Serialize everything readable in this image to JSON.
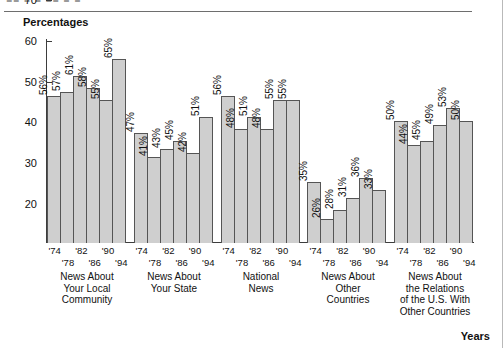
{
  "page": {
    "cropped_header_text": "■■ ■ ■ ■■ ■ ■",
    "years_axis_label": "Years"
  },
  "chart_data": {
    "type": "bar",
    "title": "Percentages",
    "xlabel": "Years",
    "ylabel": "Percentages",
    "ylim": [
      20,
      70
    ],
    "yticks": [
      20,
      30,
      40,
      50,
      60,
      70
    ],
    "grid": false,
    "legend": "none",
    "categories": [
      "'74",
      "'78",
      "'82",
      "'86",
      "'90",
      "'94"
    ],
    "groups": [
      {
        "name": "News About Your Local Community",
        "name_lines": [
          "News About",
          "Your Local",
          "Community"
        ],
        "values": [
          56,
          57,
          61,
          58,
          55,
          65
        ],
        "labels": [
          "56%",
          "57%",
          "61%",
          "58%",
          "55%",
          "65%"
        ]
      },
      {
        "name": "News About Your State",
        "name_lines": [
          "News About",
          "Your State"
        ],
        "values": [
          47,
          41,
          43,
          45,
          42,
          51
        ],
        "labels": [
          "47%",
          "41%",
          "43%",
          "45%",
          "42%",
          "51%"
        ]
      },
      {
        "name": "National News",
        "name_lines": [
          "National",
          "News"
        ],
        "values": [
          56,
          48,
          51,
          48,
          55,
          55
        ],
        "labels": [
          "56%",
          "48%",
          "51%",
          "48%",
          "55%",
          "55%"
        ]
      },
      {
        "name": "News About Other Countries",
        "name_lines": [
          "News About",
          "Other",
          "Countries"
        ],
        "values": [
          35,
          26,
          28,
          31,
          36,
          33
        ],
        "labels": [
          "35%",
          "26%",
          "28%",
          "31%",
          "36%",
          "33%"
        ]
      },
      {
        "name": "News About the Relations of the U.S. With Other Countries",
        "name_lines": [
          "News About",
          "the Relations",
          "of the U.S. With",
          "Other Countries"
        ],
        "values": [
          50,
          44,
          45,
          49,
          53,
          50
        ],
        "labels": [
          "50%",
          "44%",
          "45%",
          "49%",
          "53%",
          "50%"
        ]
      }
    ],
    "colors": {
      "bar_fill": "#cfcfcf",
      "bar_border": "#555555",
      "axis": "#3d3d3d",
      "text": "#111111"
    }
  }
}
